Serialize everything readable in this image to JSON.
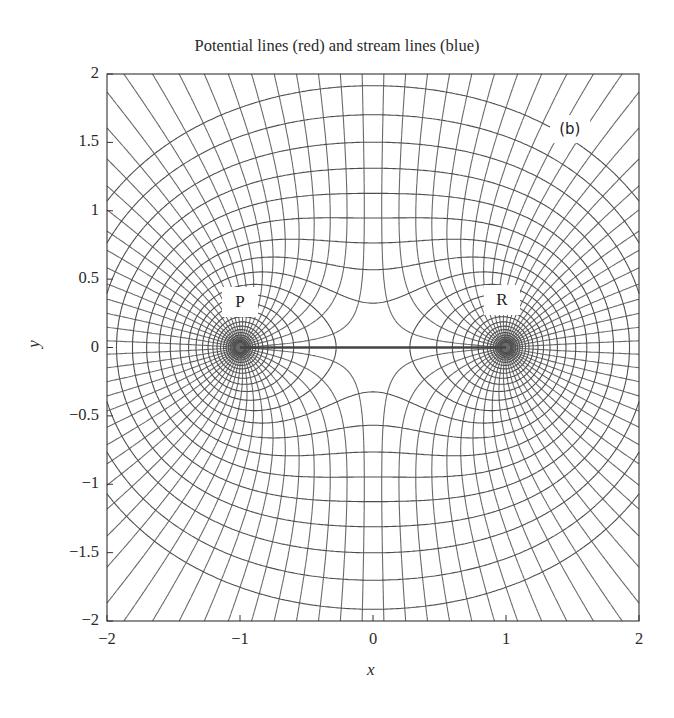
{
  "chart_data": {
    "type": "contour",
    "title": "Potential lines (red) and stream lines (blue)",
    "xlabel": "x",
    "ylabel": "y",
    "xlim": [
      -2,
      2
    ],
    "ylim": [
      -2,
      2
    ],
    "x_ticks": [
      -2,
      -1,
      0,
      1,
      2
    ],
    "x_tick_labels": [
      "−2",
      "−1",
      "0",
      "1",
      "2"
    ],
    "y_ticks": [
      2,
      1.5,
      1,
      0.5,
      0,
      -0.5,
      -1,
      -1.5,
      -2
    ],
    "y_tick_labels": [
      "2",
      "1.5",
      "1",
      "0.5",
      "0",
      "−0.5",
      "−1",
      "−1.5",
      "−2"
    ],
    "grid": false,
    "sources": [
      {
        "name": "P",
        "x": -1,
        "y": 0,
        "strength": 1
      },
      {
        "name": "R",
        "x": 1,
        "y": 0,
        "strength": 1
      }
    ],
    "potential_function": "phi = ln(r1) + ln(r2)",
    "stream_function": "psi = theta1 + theta2",
    "potential_levels": {
      "min": -2.6,
      "max": 1.7,
      "step": 0.18
    },
    "stream_levels_deg": {
      "step": 7.5
    },
    "stagnation_point": {
      "x": 0,
      "y": 0
    },
    "segment": {
      "from": [
        -1,
        0
      ],
      "to": [
        1,
        0
      ]
    },
    "annotations": [
      {
        "text": "P",
        "x": -1.0,
        "y": 0.33
      },
      {
        "text": "R",
        "x": 0.97,
        "y": 0.35
      },
      {
        "text": "(b)",
        "x": 1.48,
        "y": 1.6
      }
    ],
    "line_color": "#5a5a5a"
  },
  "labels": {
    "title": "Potential lines (red) and stream lines (blue)",
    "xlabel": "x",
    "ylabel": "y",
    "point_p": "P",
    "point_r": "R",
    "panel": "(b)"
  }
}
